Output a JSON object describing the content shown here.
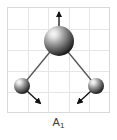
{
  "figure": {
    "label_main": "A",
    "label_subscript": "1",
    "label_full": "A1",
    "panel": {
      "background_color": "#ffffff",
      "border_color": "#d9d9d9",
      "grid_color": "#e6e6e6",
      "grid_columns": 5,
      "grid_rows": 5,
      "width": 103,
      "height": 106
    },
    "atoms": [
      {
        "name": "central-atom",
        "role": "central",
        "cx": 51,
        "cy": 33,
        "r": 15,
        "highlight_color": "#f2f2f2",
        "mid_color": "#8c8c8c",
        "edge_color": "#1a1a1a"
      },
      {
        "name": "left-atom",
        "role": "terminal",
        "cx": 14,
        "cy": 78,
        "r": 8,
        "highlight_color": "#f2f2f2",
        "mid_color": "#8c8c8c",
        "edge_color": "#1a1a1a"
      },
      {
        "name": "right-atom",
        "role": "terminal",
        "cx": 88,
        "cy": 78,
        "r": 8,
        "highlight_color": "#f2f2f2",
        "mid_color": "#8c8c8c",
        "edge_color": "#1a1a1a"
      }
    ],
    "bonds": [
      {
        "name": "bond-central-left",
        "x1": 51,
        "y1": 33,
        "x2": 14,
        "y2": 78,
        "color": "#555555"
      },
      {
        "name": "bond-central-right",
        "x1": 51,
        "y1": 33,
        "x2": 88,
        "y2": 78,
        "color": "#555555"
      }
    ],
    "displacement_arrows": [
      {
        "name": "central-atom-arrow",
        "direction": "up",
        "x1": 51,
        "y1": 28,
        "x2": 51,
        "y2": 3,
        "color": "#111111"
      },
      {
        "name": "left-atom-arrow",
        "direction": "down-right",
        "x1": 19,
        "y1": 83,
        "x2": 34,
        "y2": 97,
        "color": "#111111"
      },
      {
        "name": "right-atom-arrow",
        "direction": "down-left",
        "x1": 83,
        "y1": 83,
        "x2": 68,
        "y2": 97,
        "color": "#111111"
      }
    ]
  }
}
